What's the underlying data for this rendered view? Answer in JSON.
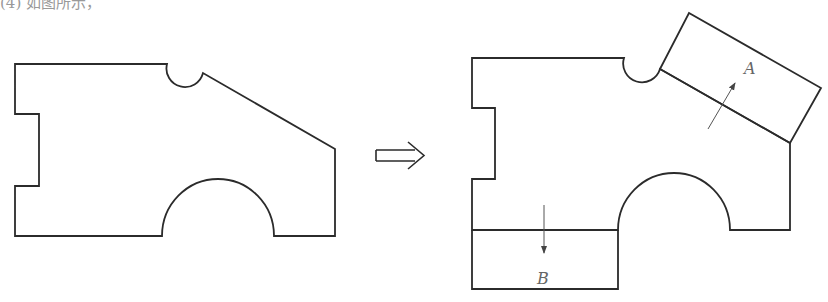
{
  "header_fragment": "(4) 如图所示，",
  "diagram": {
    "transform_arrow": "⇨",
    "labels": {
      "piece_a": "A",
      "piece_b": "B"
    },
    "colors": {
      "stroke": "#2b2b2b",
      "label": "#666666",
      "background": "#ffffff"
    },
    "left_shape": {
      "description": "Original irregular shape with left notch, top semicircle notch, slanted right top edge, and bottom semicircular arch"
    },
    "right_shape": {
      "description": "Same shape with piece A (rotated rectangle) moved up along slanted edge and piece B (rectangle) moved down below the base",
      "piece_a_direction": "up-right, perpendicular to slanted edge",
      "piece_b_direction": "down"
    }
  }
}
